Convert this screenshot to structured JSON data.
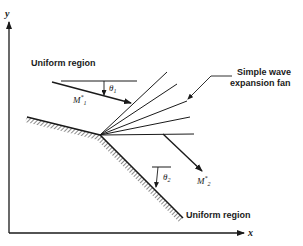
{
  "figure": {
    "axes": {
      "x_label": "x",
      "y_label": "y"
    },
    "labels": {
      "upstream_region": "Uniform region",
      "downstream_region": "Uniform region",
      "fan_label_line1": "Simple wave",
      "fan_label_line2": "expansion fan",
      "mach_upstream": "M",
      "mach_upstream_sub": "1",
      "mach_upstream_sup": "*",
      "mach_downstream": "M",
      "mach_downstream_sub": "2",
      "mach_downstream_sup": "*",
      "theta_upstream": "θ",
      "theta_upstream_sub": "1",
      "theta_downstream": "θ",
      "theta_downstream_sub": "2"
    },
    "colors": {
      "ink": "#1a1a1a",
      "background": "#ffffff"
    },
    "expansion_fan_lines": 5
  }
}
